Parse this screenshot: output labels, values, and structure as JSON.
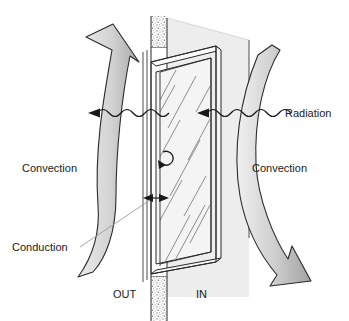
{
  "figure": {
    "background_color": "#ffffff"
  },
  "labels": {
    "radiation": "Radiation",
    "convection_outside": "Convection",
    "convection_inside": "Convection",
    "conduction": "Conduction",
    "out": "OUT",
    "in": "IN"
  },
  "colors": {
    "arrow_fill_dark": "#9a9a9a",
    "arrow_fill_light": "#d9d9d9",
    "wall_texture": "#b5b5b5",
    "glass_tint": "#f2f2f2",
    "inside_plane": "#ededed",
    "outline": "#1a1a1a",
    "leader_line": "#8c8c8c"
  },
  "elements": {
    "wall_top": "wall-section-top",
    "wall_bottom": "wall-section-bottom",
    "window_frame": "window-frame",
    "glass_pane": "glass-pane",
    "radiation_wave_left": "radiation-wave-left",
    "radiation_wave_right": "radiation-wave-right",
    "convection_arrow_left": "convection-arrow-outside",
    "convection_arrow_right": "convection-arrow-inside",
    "conduction_arrow": "conduction-arrow",
    "circulation_arrow": "air-circulation-arrow"
  }
}
